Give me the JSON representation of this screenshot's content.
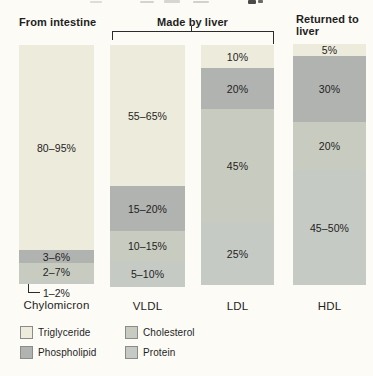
{
  "colors": {
    "background": "#fcfbf6",
    "triglyceride": "#edebdc",
    "phospholipid": "#b1b3b0",
    "cholesterol": "#c8ccc0",
    "protein": "#c6cac5",
    "text": "#1e1e1e",
    "line": "#2b2b2b"
  },
  "header": {
    "annotations": [
      {
        "text": "From intestine",
        "applies_to": [
          "Chylomicron"
        ],
        "bracket": false
      },
      {
        "text": "Made by liver",
        "applies_to": [
          "VLDL",
          "LDL"
        ],
        "bracket": true
      },
      {
        "text": "Returned to liver",
        "applies_to": [
          "HDL"
        ],
        "bracket": false
      }
    ]
  },
  "chart_data": {
    "type": "bar",
    "variant": "stacked-percentage-columns",
    "value_unit": "percent of lipoprotein composition",
    "grid": false,
    "legend_position": "bottom-left",
    "components": [
      "Triglyceride",
      "Phospholipid",
      "Cholesterol",
      "Protein"
    ],
    "categories": [
      {
        "name": "Chylomicron",
        "x": 19,
        "width": 75,
        "top": 45,
        "label_y": 299,
        "segments": [
          {
            "component": "Triglyceride",
            "label": "80–95%",
            "pct": [
              80,
              95
            ],
            "height_px": 205
          },
          {
            "component": "Phospholipid",
            "label": "3–6%",
            "pct": [
              3,
              6
            ],
            "height_px": 13
          },
          {
            "component": "Cholesterol",
            "label": "2–7%",
            "pct": [
              2,
              7
            ],
            "height_px": 18
          },
          {
            "component": "Protein",
            "label": "1–2%",
            "pct": [
              1,
              2
            ],
            "height_px": 3,
            "label_inside": false
          }
        ]
      },
      {
        "name": "VLDL",
        "x": 110,
        "width": 75,
        "top": 45,
        "label_y": 300,
        "segments": [
          {
            "component": "Triglyceride",
            "label": "55–65%",
            "pct": [
              55,
              65
            ],
            "height_px": 141
          },
          {
            "component": "Phospholipid",
            "label": "15–20%",
            "pct": [
              15,
              20
            ],
            "height_px": 45
          },
          {
            "component": "Cholesterol",
            "label": "10–15%",
            "pct": [
              10,
              15
            ],
            "height_px": 30
          },
          {
            "component": "Protein",
            "label": "5–10%",
            "pct": [
              5,
              10
            ],
            "height_px": 26
          }
        ]
      },
      {
        "name": "LDL",
        "x": 201,
        "width": 73,
        "top": 45,
        "label_y": 300,
        "segments": [
          {
            "component": "Triglyceride",
            "label": "10%",
            "pct": 10,
            "height_px": 23
          },
          {
            "component": "Phospholipid",
            "label": "20%",
            "pct": 20,
            "height_px": 41
          },
          {
            "component": "Cholesterol",
            "label": "45%",
            "pct": 45,
            "height_px": 113
          },
          {
            "component": "Protein",
            "label": "25%",
            "pct": 25,
            "height_px": 63
          }
        ]
      },
      {
        "name": "HDL",
        "x": 293,
        "width": 73,
        "top": 44,
        "label_y": 300,
        "segments": [
          {
            "component": "Triglyceride",
            "label": "5%",
            "pct": 5,
            "height_px": 12
          },
          {
            "component": "Phospholipid",
            "label": "30%",
            "pct": 30,
            "height_px": 66
          },
          {
            "component": "Cholesterol",
            "label": "20%",
            "pct": 20,
            "height_px": 48
          },
          {
            "component": "Protein",
            "label": "45–50%",
            "pct": [
              45,
              50
            ],
            "height_px": 115
          }
        ]
      }
    ]
  },
  "legend": {
    "items": [
      {
        "label": "Triglyceride",
        "color_key": "triglyceride"
      },
      {
        "label": "Phospholipid",
        "color_key": "phospholipid"
      },
      {
        "label": "Cholesterol",
        "color_key": "cholesterol"
      },
      {
        "label": "Protein",
        "color_key": "protein"
      }
    ]
  }
}
